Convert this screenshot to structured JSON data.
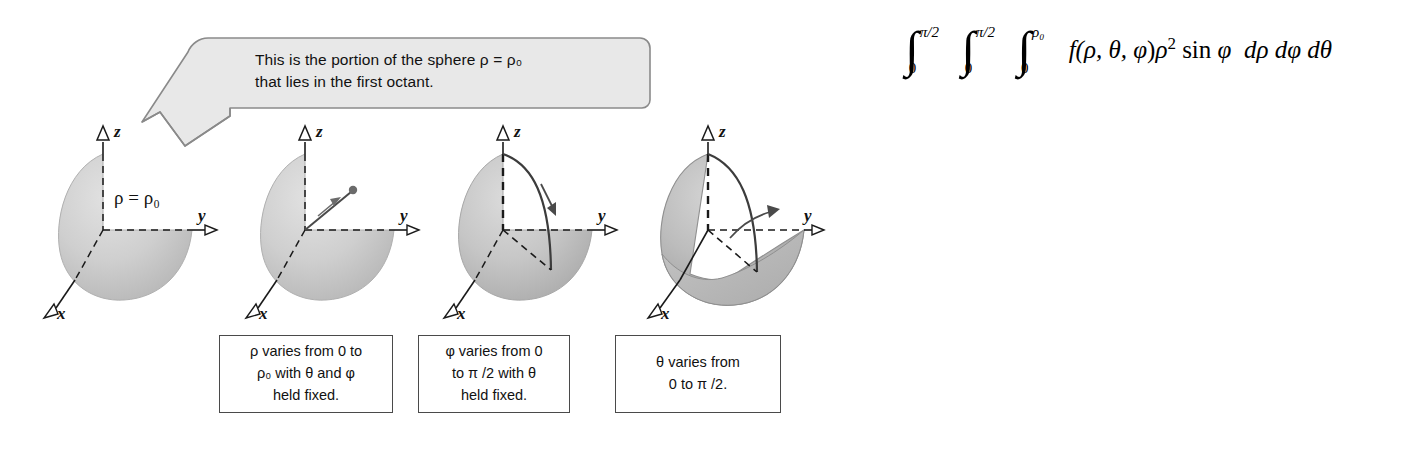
{
  "figure": {
    "background": "#ffffff"
  },
  "callout": {
    "line1": "This is the portion of the sphere ρ = ρ₀",
    "line2": "that lies in the first octant.",
    "fill": "#e8e8e8",
    "stroke": "#8a8a8a"
  },
  "panels": [
    {
      "id": "panel-1",
      "axis_labels": {
        "z": "z",
        "y": "y",
        "x": "x"
      },
      "surface_label": "ρ = ρ₀",
      "shading": "#c9c9c9",
      "caption": null
    },
    {
      "id": "panel-2",
      "axis_labels": {
        "z": "z",
        "y": "y",
        "x": "x"
      },
      "surface_label": "",
      "shading": "#c9c9c9",
      "caption": {
        "line1": "ρ varies from 0 to",
        "line2": "ρ₀ with θ  and φ",
        "line3": "held fixed."
      }
    },
    {
      "id": "panel-3",
      "axis_labels": {
        "z": "z",
        "y": "y",
        "x": "x"
      },
      "surface_label": "",
      "shading": "#c2c2c2",
      "caption": {
        "line1": "φ varies from 0",
        "line2": "to π /2 with θ",
        "line3": "held fixed."
      }
    },
    {
      "id": "panel-4",
      "axis_labels": {
        "z": "z",
        "y": "y",
        "x": "x"
      },
      "surface_label": "",
      "shading": "#b0b0b0",
      "caption": {
        "line1": "θ  varies from",
        "line2": "0 to π /2.",
        "line3": ""
      }
    }
  ],
  "integral": {
    "full_text": "∫₀^{π/2} ∫₀^{π/2} ∫₀^{ρ₀} f(ρ, θ, φ)ρ² sin φ dρ dφ dθ",
    "outer_upper": "π/2",
    "outer_lower": "0",
    "middle_upper": "π/2",
    "middle_lower": "0",
    "inner_upper": "ρ₀",
    "inner_lower": "0",
    "integrand_f": "f(",
    "integrand_args": "ρ, θ, φ",
    "integrand_close": ")",
    "rho_sq": "ρ",
    "rho_exp": "2",
    "sin_term": "sin",
    "sin_var": "φ",
    "d1": "dρ",
    "d2": "dφ",
    "d3": "dθ"
  },
  "colors": {
    "axis": "#1a1a1a",
    "sphere_light": "#d2d2d2",
    "sphere_mid": "#bdbdbd",
    "sphere_dark": "#a6a6a6",
    "callout_fill": "#e8e8e8",
    "box_border": "#4a4a4a"
  }
}
